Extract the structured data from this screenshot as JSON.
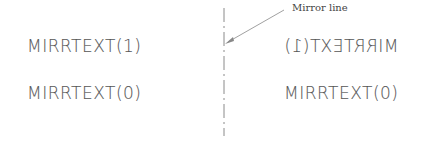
{
  "diagram": {
    "left_column": {
      "top_label": "MIRRTEXT(1)",
      "bottom_label": "MIRRTEXT(0)"
    },
    "right_column": {
      "top_label_mirrored": "MIRRTEXT(1)",
      "bottom_label": "MIRRTEXT(0)"
    },
    "mirror_line": {
      "callout": "Mirror line",
      "x": 224,
      "style": "dash-dot",
      "color": "#777777"
    },
    "text_color": "#555555"
  }
}
